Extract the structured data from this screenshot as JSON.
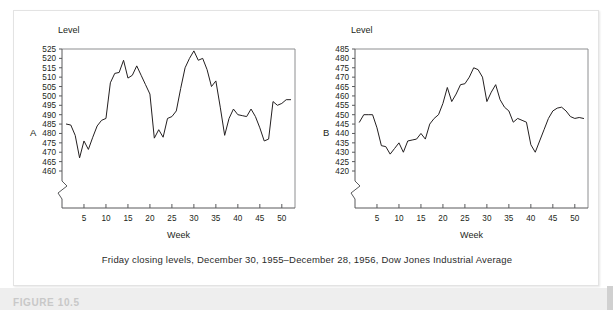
{
  "figure": {
    "caption": "Friday closing levels, December 30, 1955–December 28, 1956, Dow Jones Industrial Average",
    "bottom_label": "FIGURE 10.5"
  },
  "chart_data": [
    {
      "type": "line",
      "panel_letter": "A",
      "title": "",
      "ylabel": "Level",
      "xlabel": "Week",
      "ylim": [
        455,
        525
      ],
      "xlim": [
        0,
        53
      ],
      "grid": false,
      "axis_break": true,
      "yticks": [
        460,
        465,
        470,
        475,
        480,
        485,
        490,
        495,
        500,
        505,
        510,
        515,
        520,
        525
      ],
      "xticks": [
        5,
        10,
        15,
        20,
        25,
        30,
        35,
        40,
        45,
        50
      ],
      "legend": "none",
      "series": [
        {
          "name": "Dow Jones Industrial Average (A)",
          "x": [
            1,
            2,
            3,
            4,
            5,
            6,
            7,
            8,
            9,
            10,
            11,
            12,
            13,
            14,
            15,
            16,
            17,
            18,
            19,
            20,
            21,
            22,
            23,
            24,
            25,
            26,
            27,
            28,
            29,
            30,
            31,
            32,
            33,
            34,
            35,
            36,
            37,
            38,
            39,
            40,
            41,
            42,
            43,
            44,
            45,
            46,
            47,
            48,
            49,
            50,
            51,
            52
          ],
          "values": [
            485,
            484.5,
            479,
            467,
            476,
            471.5,
            478,
            484,
            487,
            488,
            507,
            512,
            512.5,
            519,
            509.5,
            511,
            516,
            511,
            506,
            501,
            477.5,
            482,
            478,
            488,
            489,
            492,
            504,
            515,
            520,
            524,
            519,
            520,
            514,
            505,
            508,
            494,
            479,
            488,
            493,
            490,
            489.5,
            489,
            493,
            489,
            483,
            476,
            477,
            497,
            495,
            496,
            498,
            498
          ]
        }
      ]
    },
    {
      "type": "line",
      "panel_letter": "B",
      "title": "",
      "ylabel": "Level",
      "xlabel": "Week",
      "ylim": [
        415,
        485
      ],
      "xlim": [
        0,
        53
      ],
      "grid": false,
      "axis_break": true,
      "yticks": [
        420,
        425,
        430,
        435,
        440,
        445,
        450,
        455,
        460,
        465,
        470,
        475,
        480,
        485
      ],
      "xticks": [
        5,
        10,
        15,
        20,
        25,
        30,
        35,
        40,
        45,
        50
      ],
      "legend": "none",
      "series": [
        {
          "name": "Dow Jones Industrial Average (B)",
          "x": [
            1,
            2,
            3,
            4,
            5,
            6,
            7,
            8,
            9,
            10,
            11,
            12,
            13,
            14,
            15,
            16,
            17,
            18,
            19,
            20,
            21,
            22,
            23,
            24,
            25,
            26,
            27,
            28,
            29,
            30,
            31,
            32,
            33,
            34,
            35,
            36,
            37,
            38,
            39,
            40,
            41,
            42,
            43,
            44,
            45,
            46,
            47,
            48,
            49,
            50,
            51,
            52
          ],
          "values": [
            446,
            450,
            450,
            450,
            443,
            433.5,
            433,
            429,
            432,
            435,
            430,
            436,
            436.5,
            437,
            440,
            437,
            445,
            448,
            450,
            456,
            464.5,
            457,
            461,
            466,
            466.5,
            470,
            475,
            474,
            470,
            457,
            462,
            466,
            458,
            454,
            452,
            446,
            448,
            447,
            446,
            434,
            430,
            436,
            442,
            448,
            452,
            453.5,
            454,
            452,
            449,
            448,
            448.5,
            448
          ]
        }
      ]
    }
  ]
}
